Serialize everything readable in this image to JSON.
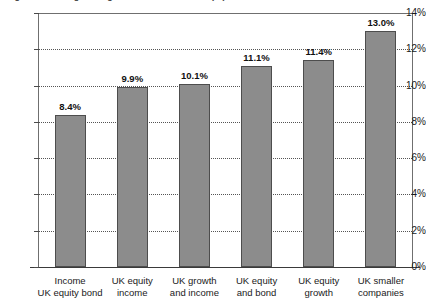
{
  "chart_data": {
    "type": "bar",
    "title": "Figure 1: Average charges for UK retail funds (%)",
    "xlabel": "",
    "ylabel": "",
    "categories": [
      "Income\nUK equity bond",
      "UK equity\nincome",
      "UK growth\nand income",
      "UK equity\nand bond",
      "UK equity\ngrowth",
      "UK smaller\ncompanies"
    ],
    "category_lines": [
      [
        "Income",
        "UK equity bond"
      ],
      [
        "UK equity",
        "income"
      ],
      [
        "UK growth",
        "and income"
      ],
      [
        "UK equity",
        "and bond"
      ],
      [
        "UK equity",
        "growth"
      ],
      [
        "UK smaller",
        "companies"
      ]
    ],
    "values": [
      8.4,
      9.9,
      10.1,
      11.1,
      11.4,
      13.0
    ],
    "value_labels": [
      "8.4%",
      "9.9%",
      "10.1%",
      "11.1%",
      "11.4%",
      "13.0%"
    ],
    "ylim": [
      0,
      14
    ],
    "ytick_values": [
      0,
      2,
      4,
      6,
      8,
      10,
      12,
      14
    ],
    "ytick_labels": [
      "0%",
      "2%",
      "4%",
      "6%",
      "8%",
      "10%",
      "12%",
      "14%"
    ],
    "grid": true,
    "grid_style": "dotted",
    "legend": "none",
    "bar_color": "#8c8c8c",
    "bar_border_color": "#4d4d4d",
    "axis_color": "#3a3a3a"
  }
}
